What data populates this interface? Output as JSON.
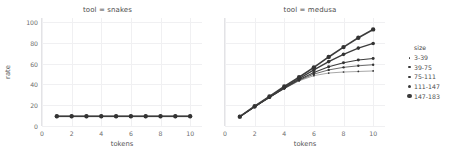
{
  "figure": {
    "xlabel": "tokens",
    "ylabel": "rate"
  },
  "panels": [
    {
      "title": "tool = snakes",
      "show_ylabel": true
    },
    {
      "title": "tool = medusa",
      "show_ylabel": false
    }
  ],
  "legend": {
    "title": "size",
    "entries": [
      {
        "label": "3-39",
        "dot": 1.4
      },
      {
        "label": "39-75",
        "dot": 1.9
      },
      {
        "label": "75-111",
        "dot": 2.4
      },
      {
        "label": "111-147",
        "dot": 2.9
      },
      {
        "label": "147-183",
        "dot": 3.5
      }
    ]
  },
  "chart_data": {
    "type": "line",
    "title": "",
    "xlabel": "tokens",
    "ylabel": "rate",
    "xlim": [
      0,
      10.8
    ],
    "ylim": [
      0,
      104
    ],
    "xticks": [
      0,
      2,
      4,
      6,
      8,
      10
    ],
    "yticks": [
      0,
      20,
      40,
      60,
      80,
      100
    ],
    "grid": true,
    "legend_position": "right",
    "legend_title": "size",
    "facet_variable": "tool",
    "size_variable": "size",
    "x": [
      1,
      2,
      3,
      4,
      5,
      6,
      7,
      8,
      9,
      10
    ],
    "facets": [
      {
        "name": "tool = snakes",
        "series": [
          {
            "name": "3-39",
            "values": [
              9.0,
              9.0,
              9.0,
              9.0,
              9.0,
              9.0,
              9.0,
              9.0,
              9.0,
              9.0
            ]
          },
          {
            "name": "39-75",
            "values": [
              9.1,
              9.1,
              9.1,
              9.1,
              9.1,
              9.1,
              9.1,
              9.1,
              9.1,
              9.1
            ]
          },
          {
            "name": "75-111",
            "values": [
              9.2,
              9.2,
              9.2,
              9.2,
              9.2,
              9.2,
              9.2,
              9.2,
              9.2,
              9.2
            ]
          },
          {
            "name": "111-147",
            "values": [
              9.3,
              9.3,
              9.3,
              9.3,
              9.3,
              9.3,
              9.3,
              9.3,
              9.3,
              9.3
            ]
          },
          {
            "name": "147-183",
            "values": [
              9.4,
              9.4,
              9.4,
              9.4,
              9.4,
              9.4,
              9.4,
              9.4,
              9.4,
              9.4
            ]
          }
        ]
      },
      {
        "name": "tool = medusa",
        "series": [
          {
            "name": "3-39",
            "values": [
              9.0,
              18.5,
              27.5,
              36.0,
              43.5,
              48.5,
              51.0,
              52.0,
              52.5,
              53.0
            ]
          },
          {
            "name": "39-75",
            "values": [
              9.0,
              18.5,
              27.5,
              36.0,
              44.0,
              50.0,
              54.0,
              56.5,
              58.0,
              59.0
            ]
          },
          {
            "name": "75-111",
            "values": [
              9.0,
              18.5,
              27.5,
              36.5,
              44.5,
              51.5,
              57.0,
              61.0,
              63.5,
              65.0
            ]
          },
          {
            "name": "111-147",
            "values": [
              9.0,
              18.5,
              28.0,
              37.0,
              45.5,
              54.0,
              62.0,
              69.0,
              75.0,
              79.5
            ]
          },
          {
            "name": "147-183",
            "values": [
              9.0,
              19.0,
              28.5,
              38.0,
              47.0,
              56.5,
              66.5,
              76.0,
              85.0,
              93.0
            ]
          }
        ]
      }
    ]
  }
}
